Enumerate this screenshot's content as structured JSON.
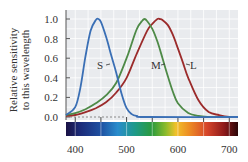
{
  "chart_data": {
    "type": "line",
    "title": "",
    "xlabel": "",
    "ylabel": "Relative sensitivity to this wavelength",
    "ylabel_lines": [
      "Relative sensitivity",
      "to this wavelength"
    ],
    "xlim": [
      382,
      717
    ],
    "ylim": [
      0.0,
      1.0
    ],
    "x_ticks": [
      400,
      500,
      600,
      700
    ],
    "x_minor_ticks": [
      400,
      450,
      500,
      550,
      600,
      650,
      700
    ],
    "y_ticks": [
      "0.0",
      "0.2",
      "0.4",
      "0.6",
      "0.8",
      "1.0"
    ],
    "grid": true,
    "legend": "inline labels",
    "spectrum_bar": true,
    "series": [
      {
        "name": "S",
        "label": "S",
        "color": "#3a6fb5",
        "peak_nm": 445,
        "x": [
          382,
          400,
          410,
          420,
          430,
          440,
          445,
          450,
          460,
          470,
          480,
          490,
          500,
          510,
          520,
          540,
          717
        ],
        "values": [
          0.02,
          0.1,
          0.3,
          0.62,
          0.88,
          0.99,
          1.0,
          0.97,
          0.82,
          0.63,
          0.45,
          0.24,
          0.09,
          0.03,
          0.01,
          0.0,
          0.0
        ]
      },
      {
        "name": "M",
        "label": "M",
        "color": "#4e8a47",
        "peak_nm": 535,
        "x": [
          382,
          400,
          420,
          440,
          460,
          480,
          500,
          510,
          520,
          530,
          535,
          540,
          550,
          560,
          570,
          580,
          590,
          600,
          620,
          640,
          660,
          680,
          717
        ],
        "values": [
          0.02,
          0.04,
          0.08,
          0.14,
          0.22,
          0.35,
          0.6,
          0.75,
          0.9,
          0.98,
          1.0,
          0.98,
          0.9,
          0.77,
          0.6,
          0.42,
          0.26,
          0.14,
          0.04,
          0.01,
          0.0,
          0.0,
          0.0
        ]
      },
      {
        "name": "L",
        "label": "L",
        "color": "#9b2b2b",
        "peak_nm": 562,
        "x": [
          382,
          400,
          420,
          440,
          460,
          480,
          500,
          520,
          540,
          550,
          560,
          565,
          570,
          580,
          590,
          600,
          610,
          620,
          640,
          660,
          680,
          700,
          717
        ],
        "values": [
          0.01,
          0.02,
          0.05,
          0.09,
          0.15,
          0.25,
          0.4,
          0.65,
          0.88,
          0.95,
          1.0,
          1.0,
          0.99,
          0.94,
          0.84,
          0.7,
          0.55,
          0.4,
          0.17,
          0.05,
          0.02,
          0.0,
          0.0
        ]
      }
    ]
  },
  "labels": {
    "s": "S",
    "m": "M",
    "l": "L"
  },
  "colors": {
    "plot_bg": "#e9ebee",
    "grid": "#ffffff",
    "axis": "#555555",
    "dashed_baseline": "#888888"
  }
}
